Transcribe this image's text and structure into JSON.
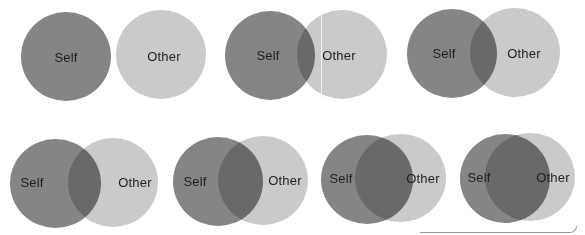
{
  "colors": {
    "self": "#858585",
    "other": "#cacaca",
    "overlap": "#6e6e6e",
    "label": "#1e1e1e",
    "background": "#ffffff"
  },
  "labels": {
    "self": "Self",
    "other": "Other"
  },
  "pairs": [
    {
      "id": 1,
      "overlap": "none",
      "self": {
        "label": "Self"
      },
      "other": {
        "label": "Other"
      }
    },
    {
      "id": 2,
      "overlap": "slight",
      "self": {
        "label": "Self"
      },
      "other": {
        "label": "Other"
      }
    },
    {
      "id": 3,
      "overlap": "small",
      "self": {
        "label": "Self"
      },
      "other": {
        "label": "Other"
      }
    },
    {
      "id": 4,
      "overlap": "moderate",
      "self": {
        "label": "Self"
      },
      "other": {
        "label": "Other"
      }
    },
    {
      "id": 5,
      "overlap": "medium",
      "self": {
        "label": "Self"
      },
      "other": {
        "label": "Other"
      }
    },
    {
      "id": 6,
      "overlap": "large",
      "self": {
        "label": "Self"
      },
      "other": {
        "label": "Other"
      }
    },
    {
      "id": 7,
      "overlap": "most",
      "self": {
        "label": "Self"
      },
      "other": {
        "label": "Other"
      }
    }
  ]
}
